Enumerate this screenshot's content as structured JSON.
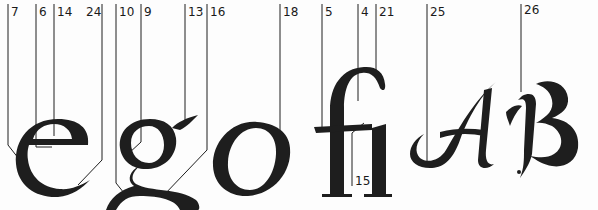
{
  "diagram": {
    "type": "letterform-anatomy",
    "ink_color": "#1e1e1e",
    "glyphs": [
      {
        "id": "e",
        "char": "e"
      },
      {
        "id": "g",
        "char": "g"
      },
      {
        "id": "o",
        "char": "o"
      },
      {
        "id": "fi",
        "char": "fi"
      },
      {
        "id": "A",
        "char": "A"
      },
      {
        "id": "B",
        "char": "B"
      }
    ],
    "callouts": [
      {
        "label": "7",
        "x": 8,
        "align": "left"
      },
      {
        "label": "6",
        "x": 36,
        "align": "left"
      },
      {
        "label": "14",
        "x": 54,
        "align": "left"
      },
      {
        "label": "24",
        "x": 102,
        "align": "right"
      },
      {
        "label": "10",
        "x": 116,
        "align": "left"
      },
      {
        "label": "9",
        "x": 141,
        "align": "left"
      },
      {
        "label": "13",
        "x": 185,
        "align": "left"
      },
      {
        "label": "16",
        "x": 207,
        "align": "left"
      },
      {
        "label": "18",
        "x": 280,
        "align": "left"
      },
      {
        "label": "5",
        "x": 322,
        "align": "left"
      },
      {
        "label": "4",
        "x": 358,
        "align": "left"
      },
      {
        "label": "21",
        "x": 376,
        "align": "left"
      },
      {
        "label": "15",
        "x": 353,
        "align": "left"
      },
      {
        "label": "25",
        "x": 427,
        "align": "left"
      },
      {
        "label": "26",
        "x": 521,
        "align": "left"
      }
    ]
  }
}
